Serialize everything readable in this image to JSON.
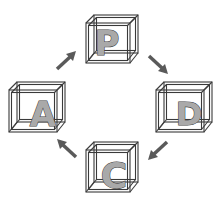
{
  "diagram": {
    "type": "cycle",
    "nodes": [
      {
        "id": "P",
        "label": "P",
        "position": "top"
      },
      {
        "id": "D",
        "label": "D",
        "position": "right"
      },
      {
        "id": "C",
        "label": "C",
        "position": "bottom"
      },
      {
        "id": "A",
        "label": "A",
        "position": "left"
      }
    ],
    "edges": [
      {
        "from": "P",
        "to": "D",
        "direction": "down-right"
      },
      {
        "from": "D",
        "to": "C",
        "direction": "down-left"
      },
      {
        "from": "C",
        "to": "A",
        "direction": "up-left"
      },
      {
        "from": "A",
        "to": "P",
        "direction": "up-right"
      }
    ],
    "colors": {
      "background": "#ffffff",
      "cube_outline": "#3a3a3a",
      "letter_fill": "#a9a9a9",
      "arrow": "#5a5a5a"
    }
  }
}
